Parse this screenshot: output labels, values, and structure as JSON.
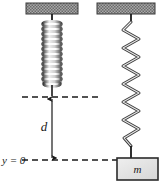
{
  "figure": {
    "kind": "physics-diagram",
    "background_color": "#ffffff",
    "width": 168,
    "height": 190
  },
  "labels": {
    "displacement": "d",
    "origin": "y = 0",
    "mass": "m"
  },
  "colors": {
    "ink": "#1a1a1a",
    "spring_stroke": "#2b2b2b",
    "spring_highlight": "#f2f2f2",
    "support_fill": "#9c9c9c",
    "support_hatch": "#5e5e5e",
    "support_edge": "#3a3a3a",
    "block_fill": "#e2e2e2",
    "block_edge": "#2b2b2b",
    "dashed_line": "#1a1a1a"
  },
  "panels": {
    "left": {
      "name": "relaxed-spring",
      "support": {
        "x": 26,
        "y": 3,
        "width": 52,
        "height": 11
      },
      "anchor_x": 52,
      "spring": {
        "state": "relaxed",
        "top_y": 20,
        "bottom_y": 88,
        "coils": 13,
        "amplitude": 10
      },
      "reference_line_y": 97
    },
    "right": {
      "name": "stretched-spring-with-mass",
      "support": {
        "x": 97,
        "y": 3,
        "width": 58,
        "height": 11
      },
      "anchor_x": 131,
      "spring": {
        "state": "stretched",
        "top_y": 20,
        "bottom_y": 152,
        "coils": 9,
        "amplitude": 9
      },
      "block": {
        "x": 117,
        "y": 158,
        "width": 41,
        "height": 22
      }
    }
  },
  "annotations": {
    "upper_dashed_line": {
      "x1": 22,
      "x2": 101,
      "y": 97
    },
    "lower_dashed_line": {
      "x1": 22,
      "x2": 145,
      "y": 160
    },
    "dimension_arrow": {
      "x": 52,
      "y_top": 97,
      "y_bottom": 160
    },
    "displacement_label_pos": {
      "x": 44,
      "y": 130
    },
    "origin_label_pos": {
      "x": 3,
      "y": 164
    },
    "mass_label_pos": {
      "x": 137,
      "y": 173
    }
  }
}
